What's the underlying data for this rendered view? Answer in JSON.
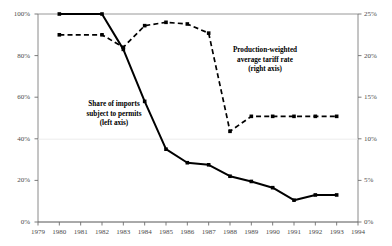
{
  "chart_data": {
    "type": "line",
    "title": "",
    "xlabel": "",
    "ylabel": "",
    "grid": false,
    "legend_position": "inline-annotations",
    "x": [
      1979,
      1980,
      1981,
      1982,
      1983,
      1984,
      1985,
      1986,
      1987,
      1988,
      1989,
      1990,
      1991,
      1992,
      1993,
      1994
    ],
    "xlim": [
      1979,
      1994
    ],
    "xtick_labels": [
      "1979",
      "1980",
      "1981",
      "1982",
      "1983",
      "1984",
      "1985",
      "1986",
      "1987",
      "1988",
      "1989",
      "1990",
      "1991",
      "1992",
      "1993",
      "1994"
    ],
    "left_axis": {
      "label": "Share of imports subject to permits (left axis)",
      "ylim": [
        0,
        100
      ],
      "unit": "%",
      "tick_values": [
        0,
        20,
        40,
        60,
        80,
        100
      ],
      "tick_labels": [
        "0%",
        "20%",
        "40%",
        "60%",
        "80%",
        "100%"
      ]
    },
    "right_axis": {
      "label": "Production-weighted average tariff rate (right axis)",
      "ylim": [
        0,
        25
      ],
      "unit": "%",
      "tick_values": [
        0,
        5,
        10,
        15,
        20,
        25
      ],
      "tick_labels": [
        "0%",
        "5%",
        "10%",
        "15%",
        "20%",
        "25%"
      ]
    },
    "series": [
      {
        "name": "Share of imports subject to permits (left axis)",
        "axis": "left",
        "style": "solid",
        "marker": "square",
        "color": "#000000",
        "x": [
          1980,
          1982,
          1983,
          1984,
          1985,
          1986,
          1987,
          1988,
          1989,
          1990,
          1991,
          1992,
          1993
        ],
        "values": [
          100,
          100,
          83,
          58,
          35,
          28.5,
          27.5,
          22,
          19.5,
          16.5,
          10.5,
          13,
          13
        ]
      },
      {
        "name": "Production-weighted average tariff rate (right axis)",
        "axis": "right",
        "style": "dashed",
        "marker": "square",
        "color": "#000000",
        "x": [
          1980,
          1982,
          1983,
          1984,
          1985,
          1986,
          1987,
          1988,
          1989,
          1990,
          1991,
          1992,
          1993
        ],
        "values": [
          22.5,
          22.5,
          21.0,
          23.6,
          24.0,
          23.8,
          22.7,
          10.9,
          12.7,
          12.7,
          12.7,
          12.7,
          12.7
        ]
      }
    ],
    "annotations": [
      {
        "id": "left-series-label",
        "lines": [
          "Share of imports",
          "subject to permits",
          "(left axis)"
        ],
        "x_px": 114,
        "y_px": 107
      },
      {
        "id": "right-series-label",
        "lines": [
          "Production-weighted",
          "average tariff rate",
          "(right axis)"
        ],
        "x_px": 265,
        "y_px": 53
      }
    ]
  }
}
